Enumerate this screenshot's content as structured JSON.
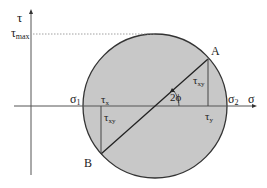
{
  "diagram": {
    "colors": {
      "background": "#ffffff",
      "circle_fill": "#c8c8c8",
      "circle_stroke": "#333333",
      "axis": "#555555",
      "line": "#222222",
      "dotted": "#888888"
    },
    "axes": {
      "vertical_label": "τ",
      "horizontal_label": "σ",
      "tau_max_label": "τ",
      "tau_max_sub": "max"
    },
    "labels": {
      "sigma1": "σ",
      "sigma1_sub": "1",
      "sigma2": "σ",
      "sigma2_sub": "2",
      "point_a": "A",
      "point_b": "B",
      "tau_x": "τ",
      "tau_x_sub": "x",
      "tau_y": "τ",
      "tau_y_sub": "y",
      "tau_xy_upper": "τ",
      "tau_xy_upper_sub": "xy",
      "tau_xy_lower": "τ",
      "tau_xy_lower_sub": "xy",
      "angle": "2ϕ"
    }
  }
}
